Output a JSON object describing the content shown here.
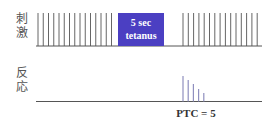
{
  "labels": {
    "stimulus": [
      "刺",
      "激"
    ],
    "response": [
      "反",
      "応"
    ]
  },
  "tetanus": {
    "line1": "5 sec",
    "line2": "tetanus",
    "color": "#4b3fc2"
  },
  "ptc_label": "PTC = 5",
  "colors": {
    "stimulus_line": "#555555",
    "response_spike": "#8f8fbf",
    "baseline": "#555555"
  },
  "stimulus": {
    "left_count": 15,
    "right_count": 15
  },
  "response": {
    "spike_count": 5
  }
}
